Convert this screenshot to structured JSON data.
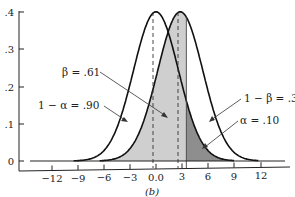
{
  "chart_data": {
    "type": "line",
    "title": "",
    "caption": "(b)",
    "xlabel": "",
    "ylabel": "",
    "xlim": [
      -15,
      15
    ],
    "ylim": [
      0,
      0.4
    ],
    "x_ticks": [
      "-12",
      "-9",
      "-6",
      "-3",
      "0.0",
      "3",
      "6",
      "9",
      "12"
    ],
    "x_tick_values": [
      -12,
      -9,
      -6,
      -3,
      0,
      3,
      6,
      9,
      12
    ],
    "y_ticks": [
      "0",
      ".1",
      ".2",
      ".3",
      ".4"
    ],
    "y_tick_values": [
      0,
      0.1,
      0.2,
      0.3,
      0.4
    ],
    "grid": false,
    "series": [
      {
        "name": "Null distribution (mean 0)",
        "mean": 0,
        "sd": 2.6,
        "peak": 0.4
      },
      {
        "name": "Alternative distribution (mean ≈ 2.8)",
        "mean": 2.8,
        "sd": 2.6,
        "peak": 0.4
      }
    ],
    "critical_value": 3.5,
    "annotations": [
      {
        "label": "β = .61",
        "region": "alternative curve left of critical value"
      },
      {
        "label": "1 − α = .90",
        "region": "null curve left of critical value"
      },
      {
        "label": "1 − β = .39",
        "region": "alternative curve right of critical value"
      },
      {
        "label": "α = .10",
        "region": "null curve right of critical value"
      }
    ],
    "colors": {
      "light_shade": "#cfcfcf",
      "dark_shade": "#8e8e8e",
      "curve": "#111111"
    }
  },
  "labels": {
    "beta": "β = .61",
    "one_minus_alpha": "1 − α = .90",
    "one_minus_beta": "1 − β = .39",
    "alpha": "α = .10",
    "caption": "(b)",
    "y": [
      ".4",
      ".3",
      ".2",
      ".1",
      "0"
    ],
    "x": [
      "−12",
      "−9",
      "−6",
      "−3",
      "0.0",
      "3",
      "6",
      "9",
      "12"
    ]
  }
}
